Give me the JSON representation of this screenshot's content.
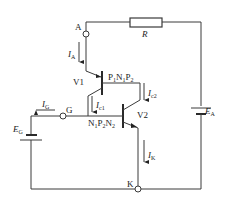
{
  "diagram": {
    "colors": {
      "line": "#3a3a3a",
      "background": "#ffffff",
      "text": "#222222"
    },
    "nodes": {
      "anode": {
        "label": "A"
      },
      "gate": {
        "label": "G"
      },
      "cathode": {
        "label": "K"
      }
    },
    "components": {
      "resistor": {
        "label": "R"
      },
      "battery_anode": {
        "label": "E",
        "sub": "A"
      },
      "battery_gate": {
        "label": "E",
        "sub": "G"
      },
      "transistor1": {
        "label": "V1",
        "structure": "P",
        "structure_parts": [
          "P",
          "1",
          "N",
          "1",
          "P",
          "2"
        ]
      },
      "transistor2": {
        "label": "V2",
        "structure_parts": [
          "N",
          "1",
          "P",
          "2",
          "N",
          "2"
        ]
      }
    },
    "currents": {
      "ia": {
        "label": "I",
        "sub": "A"
      },
      "ig": {
        "label": "I",
        "sub": "G"
      },
      "ic1": {
        "label": "I",
        "sub": "c1"
      },
      "ic2": {
        "label": "I",
        "sub": "c2"
      },
      "ik": {
        "label": "I",
        "sub": "K"
      }
    }
  }
}
